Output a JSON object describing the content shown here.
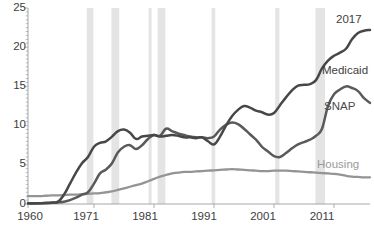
{
  "chart_data": {
    "type": "line",
    "title": "",
    "subtitle": "",
    "xlabel": "",
    "ylabel": "",
    "xlim": [
      1960,
      2017
    ],
    "ylim": [
      0,
      25
    ],
    "yticks": [
      0,
      5,
      10,
      15,
      20,
      25
    ],
    "xticks": [
      1960,
      1971,
      1981,
      1991,
      2001,
      2011
    ],
    "grid": false,
    "legend_position": "inline-right",
    "annotations": [
      {
        "text": "2017",
        "x": 2017,
        "y": 23.6
      },
      {
        "text": "Medicaid",
        "x": 2013,
        "y": 17.2
      },
      {
        "text": "SNAP",
        "x": 2014,
        "y": 12.6
      },
      {
        "text": "Housing",
        "x": 2013,
        "y": 5.1
      }
    ],
    "shaded_bands": [
      {
        "start": 1969.8,
        "end": 1970.9
      },
      {
        "start": 1973.9,
        "end": 1975.2
      },
      {
        "start": 1980.1,
        "end": 1980.6
      },
      {
        "start": 1981.6,
        "end": 1982.9
      },
      {
        "start": 1990.6,
        "end": 1991.2
      },
      {
        "start": 2001.2,
        "end": 2001.9
      },
      {
        "start": 2007.9,
        "end": 2009.5
      }
    ],
    "x": [
      1960,
      1961,
      1962,
      1963,
      1964,
      1965,
      1966,
      1967,
      1968,
      1969,
      1970,
      1971,
      1972,
      1973,
      1974,
      1975,
      1976,
      1977,
      1978,
      1979,
      1980,
      1981,
      1982,
      1983,
      1984,
      1985,
      1986,
      1987,
      1988,
      1989,
      1990,
      1991,
      1992,
      1993,
      1994,
      1995,
      1996,
      1997,
      1998,
      1999,
      2000,
      2001,
      2002,
      2003,
      2004,
      2005,
      2006,
      2007,
      2008,
      2009,
      2010,
      2011,
      2012,
      2013,
      2014,
      2015,
      2016,
      2017
    ],
    "series": [
      {
        "name": "Medicaid",
        "color": "#474747",
        "values": [
          0.1,
          0.1,
          0.1,
          0.15,
          0.2,
          0.3,
          1.2,
          2.6,
          4.0,
          5.2,
          6.0,
          7.3,
          7.8,
          8.0,
          8.6,
          9.3,
          9.5,
          9.1,
          8.3,
          8.6,
          8.7,
          8.8,
          8.6,
          8.7,
          8.8,
          8.7,
          8.5,
          8.5,
          8.4,
          8.5,
          8.0,
          7.6,
          8.6,
          10.0,
          11.2,
          12.0,
          12.5,
          12.3,
          11.9,
          11.7,
          11.4,
          11.6,
          12.6,
          13.6,
          14.5,
          15.1,
          15.2,
          15.3,
          15.8,
          17.3,
          18.3,
          18.9,
          19.3,
          19.8,
          21.0,
          21.8,
          22.1,
          22.2
        ]
      },
      {
        "name": "SNAP",
        "color": "#5a5a5a",
        "values": [
          0.05,
          0.05,
          0.1,
          0.1,
          0.15,
          0.2,
          0.3,
          0.5,
          0.8,
          1.2,
          1.5,
          2.6,
          3.9,
          4.4,
          5.2,
          6.6,
          7.3,
          7.5,
          7.0,
          7.5,
          8.3,
          8.8,
          8.7,
          9.6,
          9.3,
          9.0,
          8.8,
          8.6,
          8.5,
          8.5,
          8.4,
          8.6,
          9.5,
          10.1,
          10.4,
          10.2,
          9.6,
          8.9,
          8.2,
          7.3,
          6.7,
          6.1,
          6.0,
          6.5,
          7.1,
          7.6,
          7.9,
          8.2,
          8.7,
          9.6,
          12.5,
          14.0,
          14.6,
          15.0,
          14.8,
          14.4,
          13.5,
          12.9
        ]
      },
      {
        "name": "Housing",
        "color": "#949494",
        "values": [
          1.0,
          1.0,
          1.0,
          1.05,
          1.1,
          1.1,
          1.15,
          1.2,
          1.2,
          1.25,
          1.3,
          1.35,
          1.4,
          1.5,
          1.6,
          1.8,
          2.0,
          2.2,
          2.4,
          2.6,
          2.9,
          3.2,
          3.5,
          3.7,
          3.9,
          4.0,
          4.1,
          4.1,
          4.15,
          4.2,
          4.25,
          4.3,
          4.35,
          4.4,
          4.45,
          4.4,
          4.35,
          4.3,
          4.25,
          4.2,
          4.2,
          4.25,
          4.25,
          4.25,
          4.2,
          4.15,
          4.1,
          4.05,
          4.0,
          3.95,
          3.9,
          3.85,
          3.75,
          3.6,
          3.5,
          3.45,
          3.4,
          3.4
        ]
      }
    ]
  },
  "axis": {
    "y_labels": [
      "25",
      "20",
      "15",
      "10",
      "5",
      "0"
    ],
    "x_labels": [
      "1960",
      "1971",
      "1981",
      "1991",
      "2001",
      "2011"
    ]
  },
  "labels": {
    "year_end": "2017",
    "medicaid": "Medicaid",
    "snap": "SNAP",
    "housing": "Housing"
  },
  "colors": {
    "medicaid": "#474747",
    "snap": "#5a5a5a",
    "housing": "#949494",
    "band": "#d9d9d9",
    "axis": "#a6a6a6",
    "text": "#3d3d3d"
  }
}
